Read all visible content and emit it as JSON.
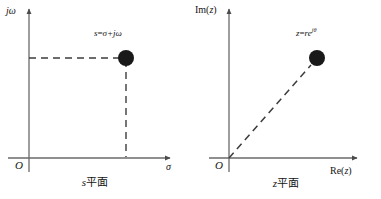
{
  "figure": {
    "background_color": "#ffffff",
    "ink_color": "#3a3a3a",
    "marker_color": "#1a1a1a"
  },
  "panels": [
    {
      "id": "s-plane",
      "caption_var": "s",
      "caption_suffix": "平面",
      "vertical_axis_label": "jω",
      "horizontal_axis_label": "σ",
      "origin_label": "O",
      "point_label_prefix": "s",
      "point_label_equals": "=",
      "point_label_value": "σ+jω",
      "marker": {
        "x": 126,
        "y": 58,
        "radius": 8
      },
      "axes": {
        "origin_x": 29,
        "origin_y": 158,
        "x_axis_end": 172,
        "y_axis_top": 7
      },
      "guides": [
        {
          "type": "horizontal-dashed",
          "from_x": 29,
          "to_x": 126,
          "y": 58
        },
        {
          "type": "vertical-dashed",
          "x": 126,
          "from_y": 58,
          "to_y": 158
        }
      ]
    },
    {
      "id": "z-plane",
      "caption_var": "z",
      "caption_suffix": "平面",
      "vertical_axis_label_fn": "Im",
      "vertical_axis_label_arg": "z",
      "horizontal_axis_label_fn": "Re",
      "horizontal_axis_label_arg": "z",
      "origin_label": "O",
      "point_label_prefix": "z",
      "point_label_equals": "=",
      "point_label_base": "re",
      "point_label_exponent": "jθ",
      "marker": {
        "x": 126,
        "y": 58,
        "radius": 8
      },
      "axes": {
        "origin_x": 38,
        "origin_y": 158,
        "x_axis_end": 168,
        "y_axis_top": 7
      },
      "guides": [
        {
          "type": "diagonal-dashed",
          "from_x": 38,
          "from_y": 158,
          "to_x": 126,
          "to_y": 58
        }
      ]
    }
  ]
}
